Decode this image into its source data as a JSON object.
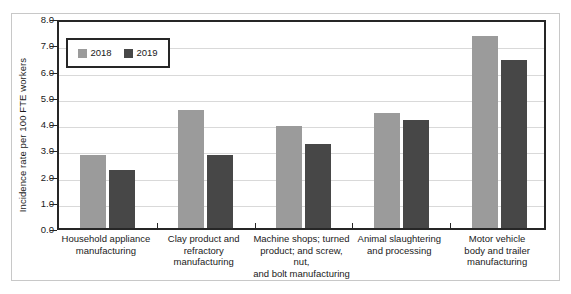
{
  "chart_data": {
    "type": "bar",
    "title": "",
    "subtitle": "",
    "xlabel": "",
    "ylabel": "Incidence rate per 100 FTE workers",
    "ylim": [
      0.0,
      8.0
    ],
    "ytick_labels": [
      "0.0",
      "1.0",
      "2.0",
      "3.0",
      "4.0",
      "5.0",
      "6.0",
      "7.0",
      "8.0"
    ],
    "ytick_values": [
      0.0,
      1.0,
      2.0,
      3.0,
      4.0,
      5.0,
      6.0,
      7.0,
      8.0
    ],
    "grid": "horizontal",
    "legend_position": "top-left",
    "categories": [
      "Household appliance manufacturing",
      "Clay product and refractory manufacturing",
      "Machine shops; turned product; and screw, nut, and bolt manufacturing",
      "Animal slaughtering and processing",
      "Motor vehicle body and trailer manufacturing"
    ],
    "category_lines": [
      [
        "Household appliance",
        "manufacturing"
      ],
      [
        "Clay product and",
        "refractory",
        "manufacturing"
      ],
      [
        "Machine shops; turned",
        "product; and screw, nut,",
        "and bolt manufacturing"
      ],
      [
        "Animal slaughtering",
        "and processing"
      ],
      [
        "Motor vehicle",
        "body and trailer",
        "manufacturing"
      ]
    ],
    "series": [
      {
        "name": "2018",
        "color": "#9b9b9b",
        "values": [
          2.8,
          4.5,
          3.9,
          4.4,
          7.3
        ]
      },
      {
        "name": "2019",
        "color": "#474747",
        "values": [
          2.2,
          2.8,
          3.2,
          4.1,
          6.4
        ]
      }
    ]
  },
  "legend": {
    "items": [
      {
        "label": "2018",
        "color": "#9b9b9b"
      },
      {
        "label": "2019",
        "color": "#474747"
      }
    ]
  },
  "colors": {
    "series_2018": "#9b9b9b",
    "series_2019": "#474747",
    "plot_frame": "#262626",
    "gridline": "#d9d9d9",
    "outer_frame": "#c8c8c8",
    "text": "#1a1a1a"
  }
}
